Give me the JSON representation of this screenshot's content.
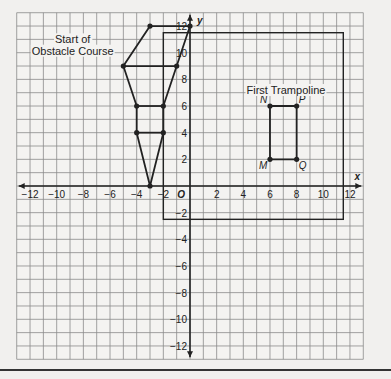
{
  "graph": {
    "x_axis_label": "x",
    "y_axis_label": "y",
    "origin_label": "O",
    "x_tick_labels": [
      "−12",
      "−10",
      "−8",
      "−6",
      "−4",
      "−2",
      "2",
      "4",
      "6",
      "8",
      "10",
      "12"
    ],
    "x_tick_values": [
      -12,
      -10,
      -8,
      -6,
      -4,
      -2,
      2,
      4,
      6,
      8,
      10,
      12
    ],
    "y_tick_labels": [
      "12",
      "10",
      "8",
      "6",
      "4",
      "2",
      "−2",
      "−4",
      "−6",
      "−8",
      "−10",
      "−12"
    ],
    "y_tick_values": [
      12,
      10,
      8,
      6,
      4,
      2,
      -2,
      -4,
      -6,
      -8,
      -10,
      -12
    ],
    "grid_range": {
      "xmin": -13,
      "xmax": 13,
      "ymin": -13,
      "ymax": 13
    }
  },
  "labels": {
    "obstacle_line1": "Start of",
    "obstacle_line2": "Obstacle Course",
    "trampoline": "First Trampoline",
    "N": "N",
    "P": "P",
    "M": "M",
    "Q": "Q"
  },
  "figures": {
    "obstacle_course_vertices": [
      [
        -3.5,
        12
      ],
      [
        0,
        12
      ],
      [
        -1,
        9
      ],
      [
        -5,
        9
      ],
      [
        -3.5,
        12
      ]
    ],
    "obstacle_course_bars": [
      [
        [
          -5,
          9
        ],
        [
          -1,
          9
        ]
      ],
      [
        [
          -4,
          6
        ],
        [
          -2,
          6
        ]
      ],
      [
        [
          -4,
          4
        ],
        [
          -2,
          4
        ]
      ]
    ],
    "trampoline": {
      "M": [
        6,
        2
      ],
      "N": [
        6,
        6
      ],
      "P": [
        8,
        6
      ],
      "Q": [
        8,
        2
      ]
    },
    "large_rectangle": {
      "x1": -2,
      "y1": -2.5,
      "x2": 11.5,
      "y2": 11.5
    }
  }
}
